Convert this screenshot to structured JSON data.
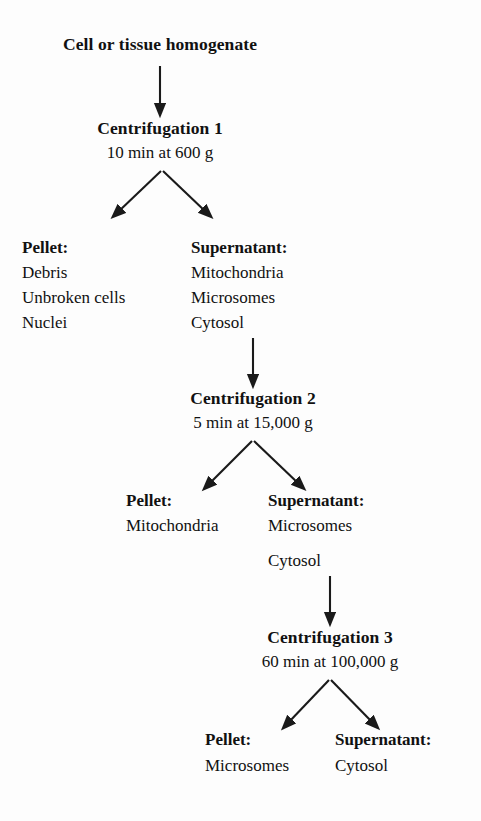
{
  "diagram": {
    "title": "Cell or tissue homogenate",
    "type": "flowchart",
    "steps": [
      {
        "name": "Centrifugation 1",
        "conditions": "10 min at 600 g",
        "outputs": [
          {
            "label": "Pellet:",
            "contents": [
              "Debris",
              "Unbroken cells",
              "Nuclei"
            ]
          },
          {
            "label": "Supernatant:",
            "contents": [
              "Mitochondria",
              "Microsomes",
              "Cytosol"
            ]
          }
        ]
      },
      {
        "name": "Centrifugation 2",
        "conditions": "5 min at 15,000 g",
        "outputs": [
          {
            "label": "Pellet:",
            "contents": [
              "Mitochondria"
            ]
          },
          {
            "label": "Supernatant:",
            "contents": [
              "Microsomes",
              "Cytosol"
            ]
          }
        ]
      },
      {
        "name": "Centrifugation 3",
        "conditions": "60 min at 100,000 g",
        "outputs": [
          {
            "label": "Pellet:",
            "contents": [
              "Microsomes"
            ]
          },
          {
            "label": "Supernatant:",
            "contents": [
              "Cytosol"
            ]
          }
        ]
      }
    ],
    "colors": {
      "background": "#fdfdfd",
      "text": "#111111",
      "arrow": "#1a1a1a"
    }
  }
}
